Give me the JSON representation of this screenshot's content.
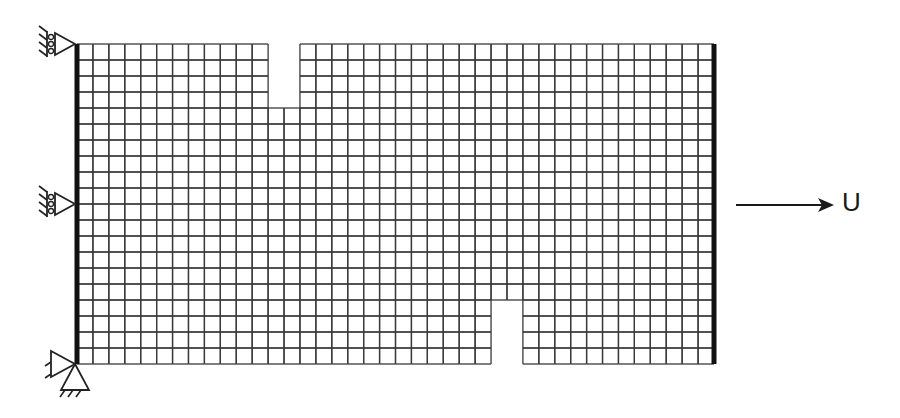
{
  "diagram": {
    "type": "finite-element-mesh",
    "mesh": {
      "left": 77,
      "top": 44,
      "right": 714,
      "bottom": 364,
      "columns": 40,
      "rows": 20,
      "line_color": "#3a3a3a",
      "edge_color": "#111111"
    },
    "notches": [
      {
        "name": "top-notch",
        "col_start": 12,
        "col_span": 2,
        "row_start": 0,
        "row_span": 4
      },
      {
        "name": "bottom-notch",
        "col_start": 26,
        "col_span": 2,
        "row_start": 16,
        "row_span": 4
      }
    ],
    "supports": [
      {
        "name": "roller-support-top",
        "type": "roller",
        "y": 44
      },
      {
        "name": "roller-support-middle",
        "type": "roller",
        "y": 204
      },
      {
        "name": "pin-support-bottom",
        "type": "pin",
        "y": 364
      }
    ],
    "load": {
      "label": "U",
      "description": "prescribed displacement arrow"
    }
  }
}
